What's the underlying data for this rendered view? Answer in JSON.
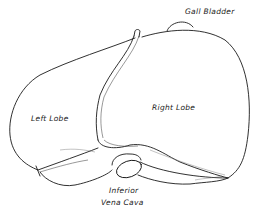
{
  "figure": {
    "labels": {
      "gall_bladder": "Gall Bladder",
      "left_lobe": "Left Lobe",
      "right_lobe": "Right Lobe",
      "ivc_line1": "Inferior",
      "ivc_line2": "Vena Cava"
    },
    "colors": {
      "line": "#1a1a1a",
      "background": "#ffffff"
    }
  }
}
